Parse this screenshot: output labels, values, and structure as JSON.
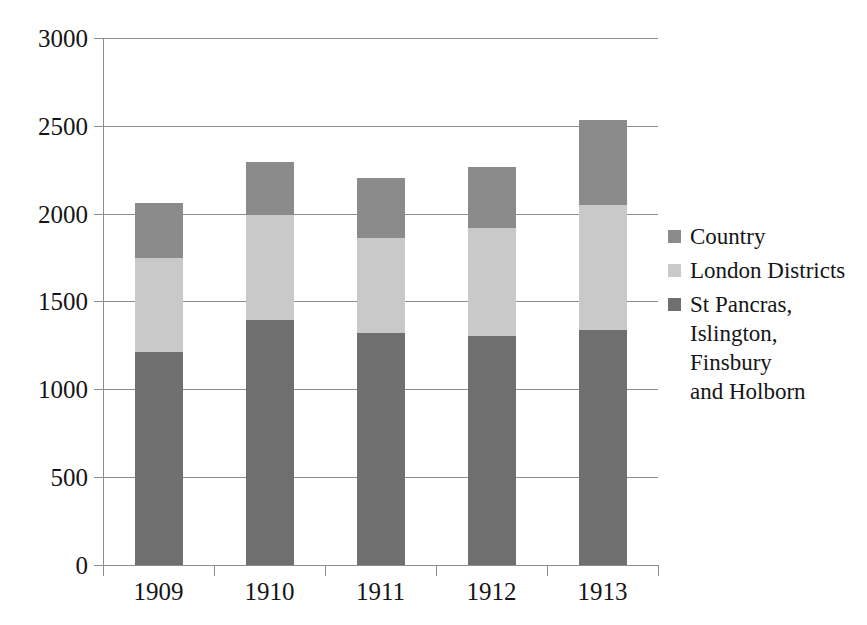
{
  "chart_data": {
    "type": "bar",
    "subtype": "stacked-column",
    "title": "",
    "subtitle": "",
    "xlabel": "",
    "ylabel": "",
    "categories": [
      "1909",
      "1910",
      "1911",
      "1912",
      "1913"
    ],
    "series": [
      {
        "name": "St Pancras,\nIslington,\nFinsbury\nand Holborn",
        "legend_label": "St Pancras,\nIslington,\nFinsbury\nand Holborn",
        "color": "#6f6f6f",
        "values": [
          1212,
          1394,
          1320,
          1303,
          1337
        ]
      },
      {
        "name": "London Districts",
        "legend_label": "London Districts",
        "color": "#c9c9c9",
        "values": [
          535,
          598,
          541,
          615,
          711
        ]
      },
      {
        "name": "Country",
        "legend_label": "Country",
        "color": "#8b8b8b",
        "values": [
          313,
          302,
          342,
          347,
          484
        ]
      }
    ],
    "stack_order_bottom_to_top": [
      "St Pancras,\nIslington,\nFinsbury\nand Holborn",
      "London Districts",
      "Country"
    ],
    "totals": [
      2060,
      2294,
      2203,
      2265,
      2532
    ],
    "ylim": [
      0,
      3000
    ],
    "yticks": [
      0,
      500,
      1000,
      1500,
      2000,
      2500,
      3000
    ],
    "ytick_labels": [
      "0",
      "500",
      "1000",
      "1500",
      "2000",
      "2500",
      "3000"
    ],
    "grid": true,
    "grid_axis": "y",
    "legend_position": "right",
    "legend_order_top_to_bottom": [
      "Country",
      "London Districts",
      "St Pancras,\nIslington,\nFinsbury\nand Holborn"
    ],
    "background_color": "#ffffff",
    "axis_color": "#8d8d8d",
    "text_color": "#151515"
  },
  "legend": {
    "items": [
      {
        "label": "Country",
        "color": "#8b8b8b"
      },
      {
        "label": "London Districts",
        "color": "#c9c9c9"
      },
      {
        "label": "St Pancras,\nIslington,\nFinsbury\nand Holborn",
        "color": "#6f6f6f"
      }
    ]
  },
  "axes": {
    "y": {
      "ticks": [
        "3000",
        "2500",
        "2000",
        "1500",
        "1000",
        "500",
        "0"
      ]
    },
    "x": {
      "ticks": [
        "1909",
        "1910",
        "1911",
        "1912",
        "1913"
      ]
    }
  }
}
